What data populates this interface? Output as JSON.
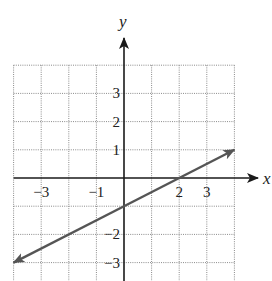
{
  "chart_data": {
    "type": "line",
    "title": "",
    "xlabel": "x",
    "ylabel": "y",
    "xlim": [
      -4,
      4
    ],
    "ylim": [
      -4,
      4
    ],
    "grid": true,
    "grid_style": "dotted",
    "x_tick_labels": [
      "-3",
      "-1",
      "2",
      "3"
    ],
    "x_tick_values": [
      -3,
      -1,
      2,
      3
    ],
    "y_tick_labels": [
      "3",
      "2",
      "1",
      "-2",
      "-3"
    ],
    "y_tick_values": [
      3,
      2,
      1,
      -2,
      -3
    ],
    "series": [
      {
        "name": "line",
        "equation": "y = x/2 - 1",
        "slope": 0.5,
        "y_intercept": -1,
        "x_intercept": 2,
        "x": [
          -4,
          -2,
          0,
          2,
          4
        ],
        "y": [
          -3,
          -2,
          -1,
          0,
          1
        ],
        "arrows": "both ends"
      }
    ],
    "legend": null
  },
  "layout": {
    "origin_px": [
      124,
      178
    ],
    "unit_x_px": 27.6,
    "unit_y_px": 28.2,
    "colors": {
      "grid": "#8a8a8a",
      "axis": "#1a1a1a",
      "line": "#555555",
      "text": "#222222"
    }
  }
}
